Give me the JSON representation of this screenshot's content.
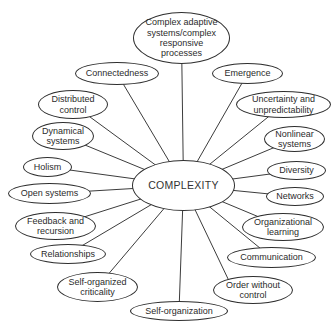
{
  "figure": {
    "kind": "concept-map",
    "background_color": "#ffffff",
    "line_color": "#3c3c3c",
    "ellipse_border_color": "#2e2e2e",
    "ellipse_fill_color": "#ffffff",
    "text_color": "#2b2b2b"
  },
  "center": {
    "label": "COMPLEXITY",
    "x": 132,
    "y": 160,
    "w": 103,
    "h": 51
  },
  "nodes": [
    {
      "id": "complex-adaptive-systems",
      "label": "Complex adaptive\nsystems/complex\nresponsive\nprocesses",
      "x": 133,
      "y": 12,
      "w": 97,
      "h": 52
    },
    {
      "id": "connectedness",
      "label": "Connectedness",
      "x": 75,
      "y": 62,
      "w": 84,
      "h": 23
    },
    {
      "id": "emergence",
      "label": "Emergence",
      "x": 212,
      "y": 63,
      "w": 71,
      "h": 21
    },
    {
      "id": "distributed-control",
      "label": "Distributed\ncontrol",
      "x": 38,
      "y": 90,
      "w": 70,
      "h": 29
    },
    {
      "id": "uncertainty-and-unpredictability",
      "label": "Uncertainty and\nunpredictability",
      "x": 236,
      "y": 91,
      "w": 95,
      "h": 27
    },
    {
      "id": "dynamical-systems",
      "label": "Dynamical\nsystems",
      "x": 32,
      "y": 122,
      "w": 62,
      "h": 28
    },
    {
      "id": "nonlinear-systems",
      "label": "Nonlinear\nsystems",
      "x": 264,
      "y": 126,
      "w": 61,
      "h": 26
    },
    {
      "id": "holism",
      "label": "Holism",
      "x": 23,
      "y": 157,
      "w": 49,
      "h": 20
    },
    {
      "id": "diversity",
      "label": "Diversity",
      "x": 267,
      "y": 161,
      "w": 59,
      "h": 19
    },
    {
      "id": "open-systems",
      "label": "Open systems",
      "x": 8,
      "y": 183,
      "w": 83,
      "h": 21
    },
    {
      "id": "networks",
      "label": "Networks",
      "x": 266,
      "y": 187,
      "w": 58,
      "h": 19
    },
    {
      "id": "feedback-and-recursion",
      "label": "Feedback and\nrecursion",
      "x": 15,
      "y": 212,
      "w": 81,
      "h": 28
    },
    {
      "id": "organizational-learning",
      "label": "Organizational\nlearning",
      "x": 242,
      "y": 213,
      "w": 82,
      "h": 28
    },
    {
      "id": "relationships",
      "label": "Relationships",
      "x": 30,
      "y": 244,
      "w": 76,
      "h": 20
    },
    {
      "id": "communication",
      "label": "Communication",
      "x": 227,
      "y": 247,
      "w": 89,
      "h": 21
    },
    {
      "id": "self-organized-criticality",
      "label": "Self-organized\ncriticality",
      "x": 57,
      "y": 272,
      "w": 81,
      "h": 30
    },
    {
      "id": "order-without-control",
      "label": "Order without\ncontrol",
      "x": 213,
      "y": 276,
      "w": 80,
      "h": 28,
      "ax": 230,
      "ay": 283
    },
    {
      "id": "self-organization",
      "label": "Self-organization",
      "x": 130,
      "y": 301,
      "w": 98,
      "h": 20
    }
  ]
}
